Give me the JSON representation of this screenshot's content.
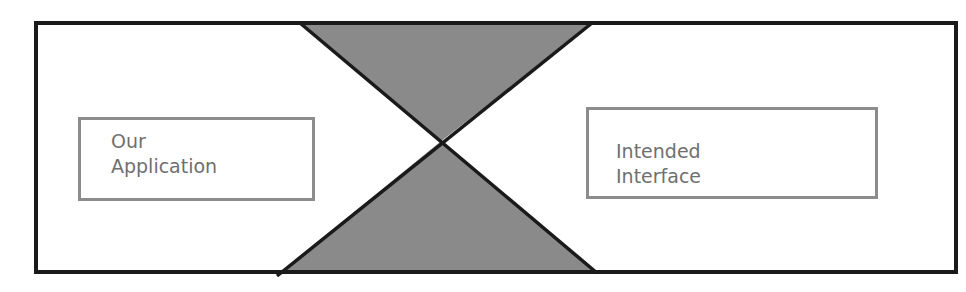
{
  "diagram": {
    "title": "",
    "colors": {
      "outline": "#1a1a1a",
      "funnel_fill": "#8a8a8a",
      "box_border": "#8c8c8c",
      "box_text": "#6f6f6f",
      "background": "#ffffff"
    },
    "boxes": [
      {
        "id": "left",
        "lines": [
          "Our",
          "Application"
        ]
      },
      {
        "id": "right",
        "lines": [
          "Intended",
          "Interface"
        ]
      }
    ],
    "shapes": {
      "outer_frame": "rectangle",
      "center": "hourglass (two shaded triangles meeting at a point)"
    }
  }
}
